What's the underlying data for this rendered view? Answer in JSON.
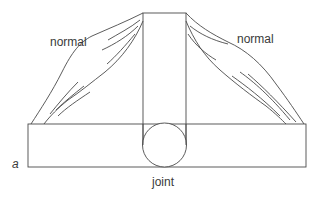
{
  "diagram": {
    "type": "joint-muscle-schematic",
    "panel_label": "a",
    "labels": {
      "muscle_left": "normal",
      "muscle_right": "normal",
      "joint": "joint"
    },
    "components": [
      {
        "id": "vertical-bone",
        "shape": "rectangle"
      },
      {
        "id": "horizontal-bone",
        "shape": "rectangle"
      },
      {
        "id": "joint",
        "shape": "circle"
      },
      {
        "id": "muscle-left",
        "shape": "fusiform-muscle",
        "state": "normal"
      },
      {
        "id": "muscle-right",
        "shape": "fusiform-muscle",
        "state": "normal"
      }
    ],
    "colors": {
      "stroke": "#4a4a4a",
      "text": "#3a3a3a",
      "background": "#ffffff"
    }
  }
}
